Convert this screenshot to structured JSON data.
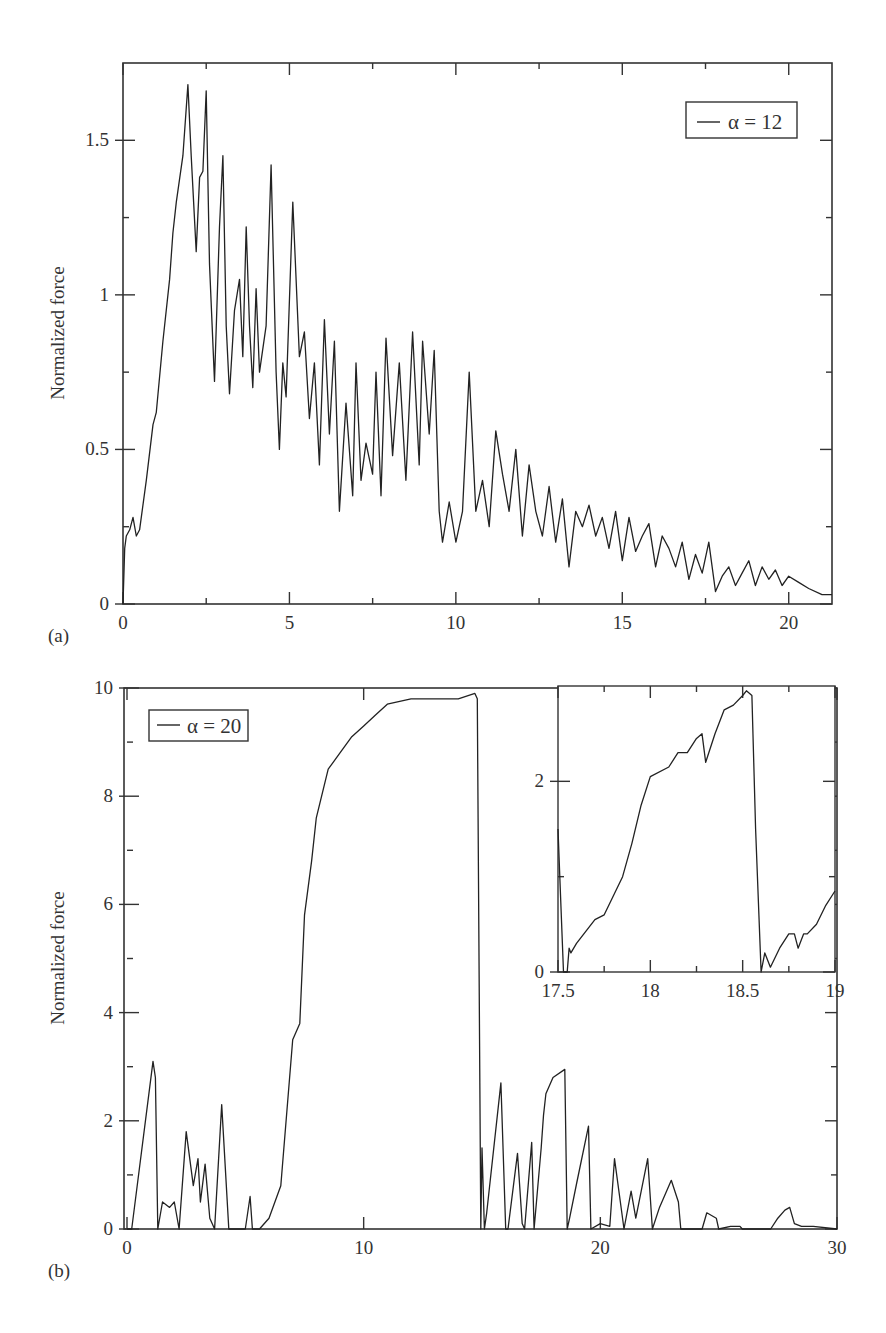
{
  "chart_data": [
    {
      "panel": "(a)",
      "type": "line",
      "title": "",
      "xlabel": "",
      "ylabel": "Normalized force",
      "xlim": [
        0,
        21.3
      ],
      "ylim": [
        0,
        1.75
      ],
      "xticks": [
        0,
        5,
        10,
        15,
        20
      ],
      "xtick_labels": [
        "0",
        "5",
        "10",
        "15",
        "20"
      ],
      "yticks": [
        0,
        0.5,
        1,
        1.5
      ],
      "ytick_labels": [
        "0",
        "0.5",
        "1",
        "1.5"
      ],
      "grid": false,
      "legend": {
        "position": "upper right",
        "entries": [
          "α = 12"
        ]
      },
      "series": [
        {
          "name": "α = 12",
          "x": [
            0,
            0.05,
            0.1,
            0.2,
            0.3,
            0.4,
            0.5,
            0.7,
            0.9,
            1.0,
            1.2,
            1.4,
            1.5,
            1.6,
            1.8,
            1.95,
            2.05,
            2.2,
            2.3,
            2.4,
            2.5,
            2.6,
            2.75,
            2.9,
            3.0,
            3.1,
            3.2,
            3.35,
            3.5,
            3.6,
            3.7,
            3.8,
            3.9,
            4.0,
            4.1,
            4.3,
            4.45,
            4.6,
            4.7,
            4.8,
            4.9,
            5.1,
            5.3,
            5.45,
            5.6,
            5.75,
            5.9,
            6.05,
            6.2,
            6.35,
            6.5,
            6.7,
            6.9,
            7.0,
            7.15,
            7.3,
            7.5,
            7.6,
            7.75,
            7.9,
            8.1,
            8.3,
            8.5,
            8.7,
            8.9,
            9.0,
            9.2,
            9.35,
            9.5,
            9.6,
            9.8,
            10.0,
            10.2,
            10.4,
            10.6,
            10.8,
            11.0,
            11.2,
            11.4,
            11.6,
            11.8,
            12.0,
            12.2,
            12.4,
            12.6,
            12.8,
            13.0,
            13.2,
            13.4,
            13.6,
            13.8,
            14.0,
            14.2,
            14.4,
            14.6,
            14.8,
            15.0,
            15.2,
            15.4,
            15.6,
            15.8,
            16.0,
            16.2,
            16.4,
            16.6,
            16.8,
            17.0,
            17.2,
            17.4,
            17.6,
            17.8,
            18.0,
            18.2,
            18.4,
            18.6,
            18.8,
            19.0,
            19.2,
            19.4,
            19.6,
            19.8,
            20.0,
            20.3,
            20.6,
            21.0,
            21.3
          ],
          "y": [
            0,
            0.18,
            0.22,
            0.24,
            0.28,
            0.22,
            0.24,
            0.4,
            0.58,
            0.62,
            0.85,
            1.05,
            1.2,
            1.3,
            1.45,
            1.68,
            1.45,
            1.14,
            1.38,
            1.4,
            1.66,
            1.1,
            0.72,
            1.22,
            1.45,
            0.9,
            0.68,
            0.95,
            1.05,
            0.8,
            1.22,
            0.9,
            0.7,
            1.02,
            0.75,
            0.9,
            1.42,
            0.75,
            0.5,
            0.78,
            0.67,
            1.3,
            0.8,
            0.88,
            0.6,
            0.78,
            0.45,
            0.92,
            0.55,
            0.85,
            0.3,
            0.65,
            0.35,
            0.78,
            0.4,
            0.52,
            0.42,
            0.75,
            0.35,
            0.86,
            0.48,
            0.78,
            0.4,
            0.88,
            0.45,
            0.85,
            0.55,
            0.82,
            0.3,
            0.2,
            0.33,
            0.2,
            0.3,
            0.75,
            0.3,
            0.4,
            0.25,
            0.56,
            0.42,
            0.3,
            0.5,
            0.22,
            0.45,
            0.3,
            0.22,
            0.38,
            0.2,
            0.34,
            0.12,
            0.3,
            0.25,
            0.32,
            0.22,
            0.28,
            0.18,
            0.3,
            0.14,
            0.28,
            0.17,
            0.22,
            0.26,
            0.12,
            0.22,
            0.18,
            0.12,
            0.2,
            0.08,
            0.16,
            0.1,
            0.2,
            0.04,
            0.09,
            0.12,
            0.06,
            0.1,
            0.14,
            0.06,
            0.12,
            0.08,
            0.11,
            0.06,
            0.09,
            0.07,
            0.05,
            0.03,
            0.03
          ]
        }
      ]
    },
    {
      "panel": "(b)",
      "type": "line",
      "title": "",
      "xlabel": "",
      "ylabel": "Normalized force",
      "xlim": [
        0,
        30
      ],
      "ylim": [
        0,
        10
      ],
      "xticks": [
        0,
        10,
        20,
        30
      ],
      "xtick_labels": [
        "0",
        "10",
        "20",
        "30"
      ],
      "yticks": [
        0,
        2,
        4,
        6,
        8,
        10
      ],
      "ytick_labels": [
        "0",
        "2",
        "4",
        "6",
        "8",
        "10"
      ],
      "grid": false,
      "legend": {
        "position": "upper left",
        "entries": [
          "α = 20"
        ]
      },
      "series": [
        {
          "name": "α = 20",
          "x": [
            0,
            0.2,
            1.1,
            1.2,
            1.3,
            1.5,
            1.8,
            2.0,
            2.2,
            2.5,
            2.8,
            3.0,
            3.1,
            3.3,
            3.5,
            3.7,
            4.0,
            4.3,
            4.4,
            5.0,
            5.2,
            5.3,
            5.6,
            6.0,
            6.5,
            7.0,
            7.3,
            7.5,
            7.8,
            8.0,
            8.5,
            9.0,
            9.5,
            10.0,
            10.5,
            11.0,
            12.0,
            13.0,
            14.0,
            14.7,
            14.8,
            14.95,
            15.0,
            15.1,
            15.2,
            15.8,
            16.0,
            16.1,
            16.5,
            16.7,
            16.8,
            17.1,
            17.2,
            17.5,
            17.6,
            17.7,
            18.0,
            18.5,
            18.6,
            18.7,
            19.0,
            19.5,
            19.6,
            20.0,
            20.4,
            20.6,
            21.0,
            21.3,
            21.5,
            22.0,
            22.2,
            22.5,
            23.0,
            23.3,
            23.4,
            24.3,
            24.5,
            24.9,
            25.0,
            25.5,
            25.9,
            26.0,
            27.2,
            27.5,
            27.8,
            28.0,
            28.2,
            28.5,
            29.0,
            30.0
          ],
          "y": [
            0,
            0,
            3.1,
            2.8,
            0,
            0.5,
            0.4,
            0.5,
            0,
            1.8,
            0.8,
            1.3,
            0.5,
            1.2,
            0.2,
            0,
            2.3,
            0,
            0,
            0,
            0.6,
            0,
            0,
            0.2,
            0.8,
            3.5,
            3.8,
            5.8,
            6.8,
            7.6,
            8.5,
            8.8,
            9.1,
            9.3,
            9.5,
            9.7,
            9.8,
            9.8,
            9.8,
            9.9,
            9.8,
            0,
            1.5,
            0,
            0.3,
            2.7,
            0,
            0,
            1.4,
            0.1,
            0,
            1.6,
            0,
            1.5,
            2.1,
            2.5,
            2.8,
            2.95,
            0,
            0.2,
            0.85,
            1.9,
            0,
            0.1,
            0.05,
            1.3,
            0,
            0.7,
            0.2,
            1.3,
            0,
            0.4,
            0.9,
            0.5,
            0,
            0,
            0.3,
            0.2,
            0,
            0.05,
            0.05,
            0,
            0,
            0.2,
            0.35,
            0.4,
            0.1,
            0.05,
            0.05,
            0
          ]
        }
      ],
      "inset": {
        "type": "line",
        "xlim": [
          17.5,
          19
        ],
        "ylim": [
          0,
          3
        ],
        "xticks": [
          17.5,
          18,
          18.5,
          19
        ],
        "xtick_labels": [
          "17.5",
          "18",
          "18.5",
          "19"
        ],
        "yticks": [
          0,
          2
        ],
        "ytick_labels": [
          "0",
          "2"
        ],
        "series": [
          {
            "name": "α = 20 (zoom)",
            "x": [
              17.5,
              17.51,
              17.53,
              17.55,
              17.56,
              17.57,
              17.6,
              17.7,
              17.75,
              17.8,
              17.85,
              17.9,
              17.95,
              18.0,
              18.1,
              18.15,
              18.2,
              18.25,
              18.28,
              18.3,
              18.35,
              18.4,
              18.45,
              18.5,
              18.52,
              18.55,
              18.57,
              18.6,
              18.62,
              18.65,
              18.7,
              18.75,
              18.78,
              18.8,
              18.83,
              18.85,
              18.9,
              18.95,
              19.0
            ],
            "y": [
              1.5,
              1.0,
              0.0,
              0.0,
              0.25,
              0.2,
              0.3,
              0.55,
              0.6,
              0.8,
              1.0,
              1.35,
              1.75,
              2.05,
              2.15,
              2.3,
              2.3,
              2.45,
              2.5,
              2.2,
              2.5,
              2.75,
              2.8,
              2.9,
              2.95,
              2.9,
              1.5,
              0.0,
              0.2,
              0.05,
              0.25,
              0.4,
              0.4,
              0.25,
              0.4,
              0.4,
              0.5,
              0.7,
              0.85
            ]
          }
        ]
      }
    }
  ],
  "panels": {
    "a": {
      "label": "(a)",
      "ylabel": "Normalized force",
      "legend": "α = 12"
    },
    "b": {
      "label": "(b)",
      "ylabel": "Normalized force",
      "legend": "α = 20"
    }
  }
}
